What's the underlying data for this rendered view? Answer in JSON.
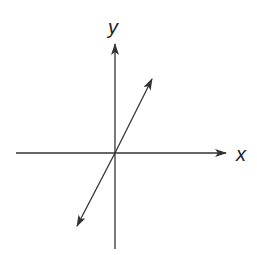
{
  "diagram": {
    "type": "coordinate-axes",
    "x_axis_label": "x",
    "y_axis_label": "y",
    "line": "straight line through origin with positive slope, arrows at both ends",
    "stroke_color": "#333333",
    "background": "#ffffff"
  }
}
